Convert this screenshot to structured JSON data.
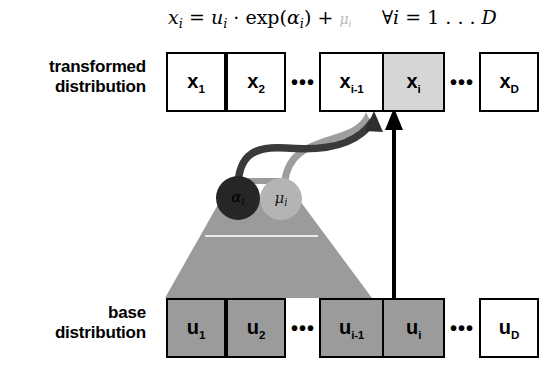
{
  "figure": {
    "formula": {
      "lhs_var": "x",
      "lhs_sub": "i",
      "eq": "=",
      "base_var": "u",
      "base_sub": "i",
      "dot": "·",
      "exp": "exp",
      "alpha_var": "α",
      "alpha_sub": "i",
      "plus": "+",
      "mu_var": "μ",
      "mu_sub": "i",
      "forall": "∀",
      "forall_var": "i",
      "range": "= 1 . . . D",
      "full_text": "x_i = u_i · exp(α_i) + μ_i   ∀i = 1...D"
    }
  },
  "rows": {
    "transformed": {
      "label_line1": "transformed",
      "label_line2": "distribution",
      "cells": [
        {
          "var": "x",
          "sub": "1",
          "fill": "white"
        },
        {
          "var": "x",
          "sub": "2",
          "fill": "white"
        },
        {
          "var": "x",
          "sub": "i-1",
          "fill": "white"
        },
        {
          "var": "x",
          "sub": "i",
          "fill": "gray-light"
        },
        {
          "var": "x",
          "sub": "D",
          "fill": "white"
        }
      ],
      "ellipsis_left": "•••",
      "ellipsis_right": "•••"
    },
    "base": {
      "label_line1": "base",
      "label_line2": "distribution",
      "cells": [
        {
          "var": "u",
          "sub": "1",
          "fill": "gray-mid"
        },
        {
          "var": "u",
          "sub": "2",
          "fill": "gray-mid"
        },
        {
          "var": "u",
          "sub": "i-1",
          "fill": "gray-mid"
        },
        {
          "var": "u",
          "sub": "i",
          "fill": "gray-mid"
        },
        {
          "var": "u",
          "sub": "D",
          "fill": "white"
        }
      ],
      "ellipsis_left": "•••",
      "ellipsis_right": "•••"
    }
  },
  "nodes": [
    {
      "name": "alpha",
      "label_var": "α",
      "label_sub": "i",
      "color": "#262626"
    },
    {
      "name": "mu",
      "label_var": "μ",
      "label_sub": "i",
      "color": "#b4b4b4"
    }
  ],
  "connectors": {
    "alpha_arrow": "curved arrow from alpha node to x_i cell",
    "mu_arrow": "curved arrow from mu node to x_i cell",
    "identity_arrow": "straight vertical arrow from u_i cell to x_i cell",
    "fan": "gray trapezoid dependency fan from base cells to nodes"
  },
  "colors": {
    "box_gray_light": "#d6d6d6",
    "box_gray_mid": "#9b9b9b",
    "fan_gray": "#9b9b9b",
    "alpha_dark": "#262626",
    "mu_gray": "#b4b4b4",
    "arrow_dark": "#3a3a3a",
    "arrow_light": "#9e9e9e",
    "stroke_black": "#000000",
    "faded_text": "#b9b9b9"
  }
}
